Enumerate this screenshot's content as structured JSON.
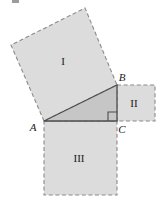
{
  "figure": {
    "background_color": "#ffffff",
    "square_fill": "#dcdcdc",
    "triangle_fill": "#c9c9c9",
    "outline_color": "#7a7a7a",
    "solid_line_color": "#4d4d4d",
    "label_color": "#1a1a1a",
    "labels": {
      "square_1": "I",
      "square_2": "II",
      "square_3": "III",
      "vertex_a": "A",
      "vertex_b": "B",
      "vertex_c": "C"
    },
    "geometry": {
      "vertex_a": [
        44,
        121
      ],
      "vertex_b": [
        117,
        85
      ],
      "vertex_c": [
        117,
        121
      ],
      "square_1_points": "44,121 11,45 85,8 117,85",
      "square_2_points": "117,85 155,85 155,121 117,121",
      "square_3_points": "44,121 117,121 117,195 44,195",
      "triangle_points": "44,121 117,85 117,121",
      "right_angle_points": "108,121 108,112 117,112"
    },
    "label_positions": {
      "square_1": [
        63,
        65
      ],
      "square_2": [
        132,
        107
      ],
      "square_3": [
        73,
        162
      ],
      "vertex_a": [
        30,
        130
      ],
      "vertex_b": [
        119,
        81
      ],
      "vertex_c": [
        119,
        133
      ]
    }
  }
}
